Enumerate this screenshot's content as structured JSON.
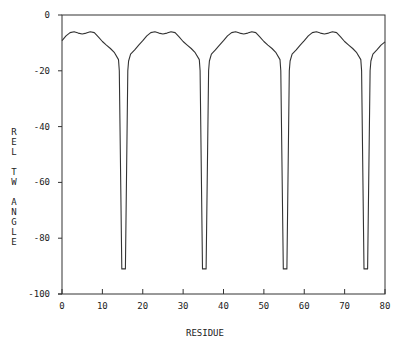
{
  "chart_data": {
    "type": "line",
    "title": "",
    "xlabel": "RESIDUE",
    "ylabel": "REL TW ANGLE",
    "xlim": [
      0,
      80
    ],
    "ylim": [
      -100,
      0
    ],
    "grid": false,
    "legend": null,
    "x_ticks": [
      0,
      10,
      20,
      30,
      40,
      50,
      60,
      70,
      80
    ],
    "x_tick_labels": [
      "0",
      "10",
      "20",
      "30",
      "40",
      "50",
      "60",
      "70",
      "80"
    ],
    "y_ticks": [
      0,
      -20,
      -40,
      -60,
      -80,
      -100
    ],
    "y_tick_labels": [
      "0",
      "-20",
      "-40",
      "-60",
      "-80",
      "-100"
    ],
    "line_color": "#333333",
    "period": 20,
    "series": [
      {
        "name": "REL TW ANGLE",
        "x": [
          0,
          1,
          2,
          3,
          4,
          5,
          6,
          7,
          8,
          9,
          10,
          11,
          12,
          13,
          14,
          14.2,
          14.8,
          15.7,
          16.3,
          16.5,
          17,
          18,
          19,
          20,
          21,
          22,
          23,
          24,
          25,
          26,
          27,
          28,
          29,
          30,
          31,
          32,
          33,
          34,
          34.2,
          34.8,
          35.7,
          36.3,
          36.5,
          37,
          38,
          39,
          40,
          41,
          42,
          43,
          44,
          45,
          46,
          47,
          48,
          49,
          50,
          51,
          52,
          53,
          54,
          54.2,
          54.8,
          55.7,
          56.3,
          56.5,
          57,
          58,
          59,
          60,
          61,
          62,
          63,
          64,
          65,
          66,
          67,
          68,
          69,
          70,
          71,
          72,
          73,
          74,
          74.2,
          74.8,
          75.7,
          76.3,
          76.5,
          77,
          78,
          79,
          80
        ],
        "y": [
          -9.2,
          -7.5,
          -6.3,
          -6.0,
          -6.5,
          -6.8,
          -6.5,
          -6.0,
          -6.3,
          -7.8,
          -9.5,
          -10.8,
          -12.0,
          -13.5,
          -16.0,
          -20,
          -91,
          -91,
          -20,
          -16.5,
          -14.0,
          -12.5,
          -10.8,
          -9.2,
          -7.5,
          -6.3,
          -6.0,
          -6.5,
          -6.8,
          -6.5,
          -6.0,
          -6.3,
          -7.8,
          -9.5,
          -10.8,
          -12.0,
          -13.5,
          -16.0,
          -20,
          -91,
          -91,
          -20,
          -16.5,
          -14.0,
          -12.5,
          -10.8,
          -9.2,
          -7.5,
          -6.3,
          -6.0,
          -6.5,
          -6.8,
          -6.5,
          -6.0,
          -6.3,
          -7.8,
          -9.5,
          -10.8,
          -12.0,
          -13.5,
          -16.0,
          -20,
          -91,
          -91,
          -20,
          -16.5,
          -14.0,
          -12.5,
          -10.8,
          -9.2,
          -7.5,
          -6.3,
          -6.0,
          -6.5,
          -6.8,
          -6.5,
          -6.0,
          -6.3,
          -7.8,
          -9.5,
          -10.8,
          -12.0,
          -13.5,
          -16.0,
          -20,
          -91,
          -91,
          -20,
          -16.5,
          -14.0,
          -12.5,
          -10.8,
          -9.6
        ]
      }
    ]
  }
}
